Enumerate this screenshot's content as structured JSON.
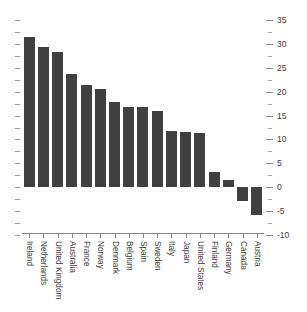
{
  "chart_data": {
    "type": "bar",
    "title": "",
    "subtitle": "",
    "xlabel": "",
    "ylabel": "",
    "categories": [
      "Ireland",
      "Netherlands",
      "United Kingdom",
      "Australia",
      "France",
      "Norway",
      "Denmark",
      "Belgium",
      "Spain",
      "Sweden",
      "Italy",
      "Japan",
      "United States",
      "Finland",
      "Germany",
      "Canada",
      "Austria"
    ],
    "values": [
      31.5,
      29.3,
      28.2,
      23.8,
      21.5,
      20.6,
      17.8,
      16.8,
      16.8,
      16.0,
      11.7,
      11.6,
      11.4,
      3.1,
      1.6,
      -2.8,
      -5.8
    ],
    "ylim": [
      -10,
      35
    ],
    "ytick_major": [
      35,
      30,
      25,
      20,
      15,
      10,
      5,
      0,
      -5,
      -10
    ],
    "ytick_minor": [
      32.5,
      27.5,
      22.5,
      17.5,
      12.5,
      7.5,
      2.5,
      -2.5,
      -7.5
    ],
    "ytick_labels": [
      "35",
      "30",
      "25",
      "20",
      "15",
      "10",
      "5",
      "0",
      "-5",
      "-10"
    ],
    "yaxis_position": "right",
    "grid": false,
    "legend": false,
    "bar_color": "#404040",
    "axis_color": "#8a8a8a",
    "label_color": "#3c3c3c",
    "background": "#ffffff",
    "baseline": 0
  }
}
